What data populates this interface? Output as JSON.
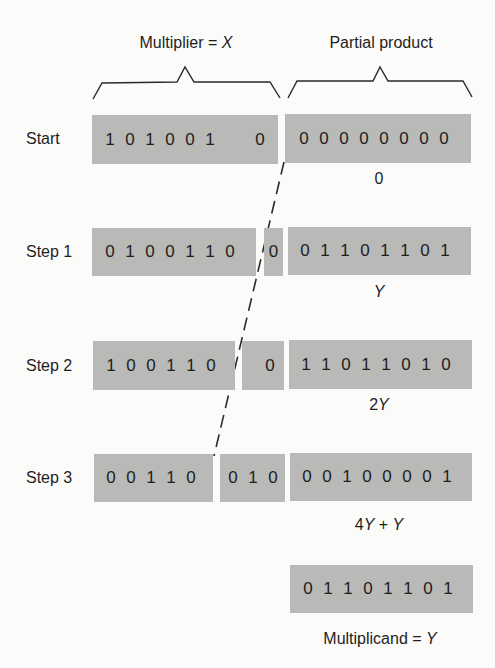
{
  "headers": {
    "multiplier": {
      "text": "Multiplier = ",
      "var": "X"
    },
    "partial_product": {
      "text": "Partial product"
    }
  },
  "rows": [
    {
      "label": "Start",
      "multiplier_bits": "101001",
      "shifted_bits": "0",
      "partial_product_bits": "00000000",
      "annotation": {
        "prefix": "0",
        "var": "",
        "suffix": ""
      }
    },
    {
      "label": "Step 1",
      "multiplier_bits": "0100110",
      "shifted_bits": "0",
      "partial_product_bits": "01101101",
      "annotation": {
        "prefix": "",
        "var": "Y",
        "suffix": ""
      }
    },
    {
      "label": "Step 2",
      "multiplier_bits": "100110",
      "shifted_bits": "0",
      "partial_product_bits": "11011010",
      "annotation": {
        "prefix": "2",
        "var": "Y",
        "suffix": ""
      }
    },
    {
      "label": "Step 3",
      "multiplier_bits": "00110",
      "shifted_bits": "010",
      "partial_product_bits": "00100001",
      "annotation": {
        "prefix": "4",
        "var": "Y",
        "suffix": " + ",
        "var2": "Y"
      }
    }
  ],
  "multiplicand": {
    "bits": "01101101",
    "label": "Multiplicand = ",
    "var": "Y"
  },
  "colors": {
    "register_fill": "#b9b9b7",
    "background": "#fbfbfa",
    "ink": "#1e1e1e"
  }
}
